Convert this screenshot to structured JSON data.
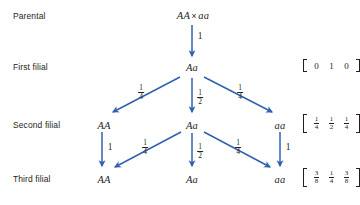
{
  "diagram": {
    "accent_color": "#3061b0",
    "text_color": "#231f20",
    "background": "#ffffff",
    "rows": [
      {
        "id": "parental",
        "label": "Parental",
        "nodes": [
          {
            "id": "p-cross",
            "text": "AA × aa",
            "left": "AA",
            "cross": "×",
            "right": "aa"
          }
        ],
        "vector": null
      },
      {
        "id": "first-filial",
        "label": "First filial",
        "nodes": [
          {
            "id": "f1-Aa",
            "text": "Aa"
          }
        ],
        "vector": {
          "cells": [
            "0",
            "1",
            "0"
          ],
          "type": "whole"
        }
      },
      {
        "id": "second-filial",
        "label": "Second filial",
        "nodes": [
          {
            "id": "f2-AA",
            "text": "AA"
          },
          {
            "id": "f2-Aa",
            "text": "Aa"
          },
          {
            "id": "f2-aa",
            "text": "aa"
          }
        ],
        "vector": {
          "cells": [
            {
              "num": "1",
              "den": "4"
            },
            {
              "num": "1",
              "den": "2"
            },
            {
              "num": "1",
              "den": "4"
            }
          ],
          "type": "fraction"
        }
      },
      {
        "id": "third-filial",
        "label": "Third filial",
        "nodes": [
          {
            "id": "f3-AA",
            "text": "AA"
          },
          {
            "id": "f3-Aa",
            "text": "Aa"
          },
          {
            "id": "f3-aa",
            "text": "aa"
          }
        ],
        "vector": {
          "cells": [
            {
              "num": "3",
              "den": "8"
            },
            {
              "num": "1",
              "den": "4"
            },
            {
              "num": "3",
              "den": "8"
            }
          ],
          "type": "fraction"
        }
      }
    ],
    "edges": [
      {
        "id": "e-p-f1",
        "from": "p-cross",
        "to": "f1-Aa",
        "label": {
          "type": "whole",
          "text": "1"
        }
      },
      {
        "id": "e-f1-f2AA",
        "from": "f1-Aa",
        "to": "f2-AA",
        "label": {
          "type": "fraction",
          "num": "1",
          "den": "4"
        }
      },
      {
        "id": "e-f1-f2Aa",
        "from": "f1-Aa",
        "to": "f2-Aa",
        "label": {
          "type": "fraction",
          "num": "1",
          "den": "2"
        }
      },
      {
        "id": "e-f1-f2aa",
        "from": "f1-Aa",
        "to": "f2-aa",
        "label": {
          "type": "fraction",
          "num": "1",
          "den": "4"
        }
      },
      {
        "id": "e-f2AA-f3AA",
        "from": "f2-AA",
        "to": "f3-AA",
        "label": {
          "type": "whole",
          "text": "1"
        }
      },
      {
        "id": "e-f2Aa-f3AA",
        "from": "f2-Aa",
        "to": "f3-AA",
        "label": {
          "type": "fraction",
          "num": "1",
          "den": "4"
        }
      },
      {
        "id": "e-f2Aa-f3Aa",
        "from": "f2-Aa",
        "to": "f3-Aa",
        "label": {
          "type": "fraction",
          "num": "1",
          "den": "2"
        }
      },
      {
        "id": "e-f2Aa-f3aa",
        "from": "f2-Aa",
        "to": "f3-aa",
        "label": {
          "type": "fraction",
          "num": "1",
          "den": "4"
        }
      },
      {
        "id": "e-f2aa-f3aa",
        "from": "f2-aa",
        "to": "f3-aa",
        "label": {
          "type": "whole",
          "text": "1"
        }
      }
    ]
  },
  "labels": {
    "row_parental": "Parental",
    "row_first": "First filial",
    "row_second": "Second filial",
    "row_third": "Third filial"
  },
  "genotypes": {
    "p_left": "AA",
    "p_cross": "×",
    "p_right": "aa",
    "f1": "Aa",
    "f2_left": "AA",
    "f2_mid": "Aa",
    "f2_right": "aa",
    "f3_left": "AA",
    "f3_mid": "Aa",
    "f3_right": "aa"
  },
  "edge_labels": {
    "p_to_f1": "1",
    "f1_to_f2_left_num": "1",
    "f1_to_f2_left_den": "4",
    "f1_to_f2_mid_num": "1",
    "f1_to_f2_mid_den": "2",
    "f1_to_f2_right_num": "1",
    "f1_to_f2_right_den": "4",
    "f2AA_to_f3AA": "1",
    "f2Aa_to_f3AA_num": "1",
    "f2Aa_to_f3AA_den": "4",
    "f2Aa_to_f3Aa_num": "1",
    "f2Aa_to_f3Aa_den": "2",
    "f2Aa_to_f3aa_num": "1",
    "f2Aa_to_f3aa_den": "4",
    "f2aa_to_f3aa": "1"
  },
  "vectors": {
    "v1": {
      "c0": "0",
      "c1": "1",
      "c2": "0"
    },
    "v2": {
      "c0_num": "1",
      "c0_den": "4",
      "c1_num": "1",
      "c1_den": "2",
      "c2_num": "1",
      "c2_den": "4"
    },
    "v3": {
      "c0_num": "3",
      "c0_den": "8",
      "c1_num": "1",
      "c1_den": "4",
      "c2_num": "3",
      "c2_den": "8"
    }
  }
}
